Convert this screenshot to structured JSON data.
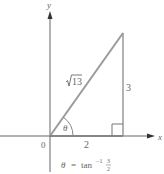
{
  "diagram": {
    "axes": {
      "x_label": "x",
      "y_label": "y",
      "origin_label": "0"
    },
    "triangle": {
      "hypotenuse_label": "√13",
      "hypotenuse_radicand": "13",
      "adjacent_label": "2",
      "opposite_label": "3",
      "angle_label": "θ"
    },
    "caption": {
      "theta": "θ",
      "equals": "=",
      "func": "tan",
      "exponent": "−1",
      "numerator": "3",
      "denominator": "2"
    },
    "colors": {
      "line": "#9a9a9a",
      "axis": "#555555",
      "text": "#666666"
    }
  }
}
